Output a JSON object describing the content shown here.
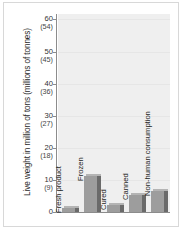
{
  "chart_data": {
    "type": "bar",
    "title": "",
    "subtitle": "",
    "xlabel": "",
    "ylabel": "Live weight in million of tons (millions of tonnes)",
    "categories": [
      "Fresh product",
      "Frozen",
      "Cured",
      "Canned",
      "Non-human consumption"
    ],
    "values": [
      1.5,
      11.5,
      2.5,
      5.5,
      7.0
    ],
    "ylim": [
      0,
      62
    ],
    "yticks": [
      0,
      10,
      20,
      30,
      40,
      50,
      60
    ],
    "ytick_labels_primary": [
      "0",
      "10",
      "20",
      "30",
      "40",
      "50",
      "60"
    ],
    "ytick_labels_secondary": [
      "",
      "(9)",
      "(18)",
      "(27)",
      "(36)",
      "(45)",
      "(54)"
    ],
    "grid": true,
    "legend": "none",
    "series": [
      {
        "name": "Live weight",
        "values": [
          1.5,
          11.5,
          2.5,
          5.5,
          7.0
        ]
      }
    ],
    "colors": {
      "bar_face": "#9d9d9d",
      "bar_side": "#6a6a6a",
      "bar_top": "#b4b4b4",
      "panel": "#efefef",
      "axis": "#8c8c8c",
      "grid": "#e6e6e6",
      "text": "#1f1f1f",
      "frame": "#d8d8d8",
      "background": "#ffffff"
    }
  }
}
